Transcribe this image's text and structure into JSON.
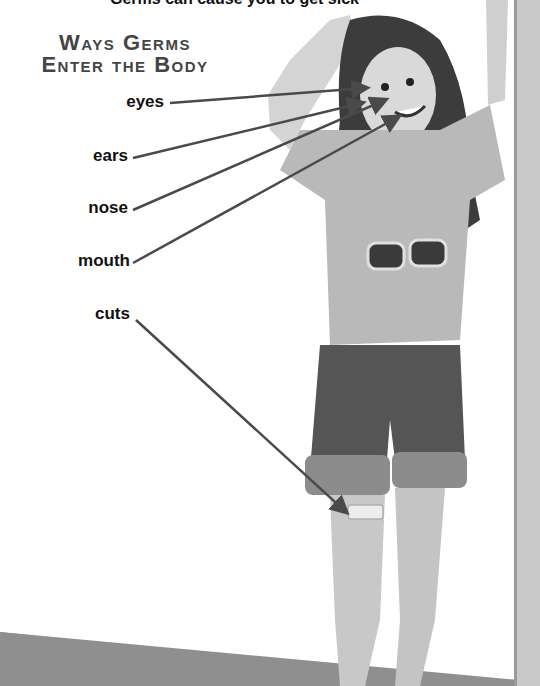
{
  "title": {
    "line1": "Ways Germs",
    "line2": "Enter the Body"
  },
  "top_cutoff_text": "Germs can cause you to get sick",
  "labels": [
    {
      "id": "eyes",
      "text": "eyes",
      "target": "eye"
    },
    {
      "id": "ears",
      "text": "ears",
      "target": "ear"
    },
    {
      "id": "nose",
      "text": "nose",
      "target": "nose"
    },
    {
      "id": "mouth",
      "text": "mouth",
      "target": "mouth"
    },
    {
      "id": "cuts",
      "text": "cuts",
      "target": "bandage on knee"
    }
  ],
  "colors": {
    "arrow": "#4a4a4a",
    "title": "#444444",
    "label": "#111111",
    "floor": "#8f8f8f",
    "wall_post": "#c9c9c9"
  }
}
